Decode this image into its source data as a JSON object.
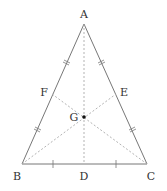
{
  "diagram": {
    "colors": {
      "stroke": "#777777",
      "dashed": "#aaaaaa",
      "text": "#333333",
      "point": "#111111"
    },
    "points": {
      "A": {
        "label": "A",
        "x": 84,
        "y": 24
      },
      "B": {
        "label": "B",
        "x": 22,
        "y": 164
      },
      "C": {
        "label": "C",
        "x": 147,
        "y": 164
      },
      "D": {
        "label": "D",
        "x": 84,
        "y": 164
      },
      "E": {
        "label": "E",
        "x": 116,
        "y": 94
      },
      "F": {
        "label": "F",
        "x": 52,
        "y": 94
      },
      "G": {
        "label": "G",
        "x": 84,
        "y": 117
      }
    },
    "segments_solid": [
      "AB",
      "AC",
      "BC"
    ],
    "segments_dashed": [
      "AD",
      "BE",
      "CF"
    ],
    "tick_marks": {
      "AB": "double tick on AF and FB",
      "AC": "double tick on AE and EC",
      "BC": "single tick on BD and DC"
    }
  }
}
